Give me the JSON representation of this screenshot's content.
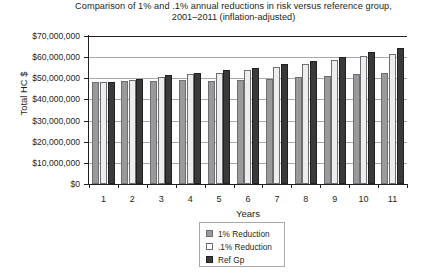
{
  "chart_data": {
    "type": "bar",
    "title": "Comparison of 1% and .1% annual reductions in risk versus reference group, 2001–2011 (inflation-adjusted)",
    "title_line1": "Comparison of 1% and .1% annual reductions in risk versus reference group,",
    "title_line2": "2001–2011 (inflation-adjusted)",
    "xlabel": "Years",
    "ylabel": "Total HC $",
    "categories": [
      "1",
      "2",
      "3",
      "4",
      "5",
      "6",
      "7",
      "8",
      "9",
      "10",
      "11"
    ],
    "ylim": [
      0,
      70000000
    ],
    "ytick_values": [
      0,
      10000000,
      20000000,
      30000000,
      40000000,
      50000000,
      60000000,
      70000000
    ],
    "ytick_labels": [
      "$0",
      "$10,000,000",
      "$20,000,000",
      "$30,000,000",
      "$40,000,000",
      "$50,000,000",
      "$60,000,000",
      "$70,000,000"
    ],
    "grid": "horizontal",
    "legend_position": "bottom-center",
    "series": [
      {
        "name": "1% Reduction",
        "color": "#9a9a9a",
        "values": [
          48200000,
          48800000,
          48900000,
          49200000,
          48900000,
          49300000,
          49700000,
          50500000,
          51300000,
          52000000,
          52500000
        ]
      },
      {
        "name": ".1% Reduction",
        "color": "#ededed",
        "values": [
          48300000,
          49300000,
          50800000,
          51900000,
          52700000,
          53700000,
          55200000,
          56800000,
          58500000,
          60600000,
          61700000
        ]
      },
      {
        "name": "Ref Gp",
        "color": "#3a3a3a",
        "values": [
          48200000,
          49900000,
          51500000,
          52700000,
          53800000,
          55000000,
          56600000,
          58300000,
          60100000,
          62600000,
          64300000
        ]
      }
    ]
  },
  "legend": {
    "items": [
      {
        "label": "1% Reduction"
      },
      {
        "label": ".1% Reduction"
      },
      {
        "label": "Ref Gp"
      }
    ]
  }
}
